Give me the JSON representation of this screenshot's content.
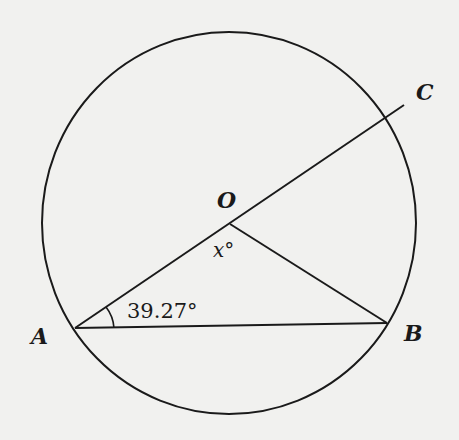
{
  "diagram": {
    "type": "circle-geometry",
    "colors": {
      "background": "#f1f1ef",
      "stroke": "#1a1a1a"
    },
    "circle": {
      "center_label": "O",
      "cx": 229,
      "cy": 223,
      "rx": 187,
      "ry": 191
    },
    "points": {
      "A": {
        "label": "A",
        "x": 75,
        "y": 328
      },
      "B": {
        "label": "B",
        "x": 387,
        "y": 323
      },
      "O": {
        "label": "O",
        "x": 230,
        "y": 224
      },
      "C": {
        "label": "C",
        "x": 404,
        "y": 105
      }
    },
    "segments": [
      {
        "from": "A",
        "to": "C",
        "description": "line through A, O, extended to C"
      },
      {
        "from": "O",
        "to": "B"
      },
      {
        "from": "A",
        "to": "B"
      }
    ],
    "angles": {
      "OAB": {
        "label": "39.27°",
        "vertex": "A"
      },
      "AOB": {
        "label": "x°",
        "vertex": "O"
      }
    }
  }
}
